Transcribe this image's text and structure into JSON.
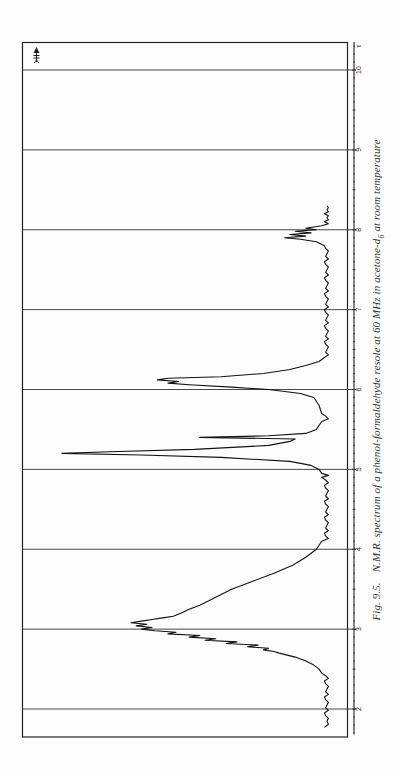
{
  "figure": {
    "caption_fig": "Fig. 9.5.",
    "caption_text_a": "N.M.R. spectrum of a phenol-formaldehyde resole at 60 MHz in acetone-d",
    "caption_sub": "6",
    "caption_text_b": " at room temperature",
    "orientation": "rotated 90° counter-clockwise",
    "field_arrow_symbol": "H0 field arrow"
  },
  "chart_data": {
    "type": "line",
    "xlabel": "τ",
    "ylabel": "",
    "xlim": [
      1.6,
      10.35
    ],
    "ylim": [
      0,
      100
    ],
    "x_ticks": [
      2,
      3,
      4,
      5,
      6,
      7,
      8,
      9,
      10
    ],
    "x_tick_labels": [
      "2",
      "3",
      "4",
      "5",
      "6",
      "7",
      "8",
      "9",
      "10"
    ],
    "axis_unit_label": "τ",
    "grid": "vertical lines at each integer τ",
    "legend": null,
    "series": [
      {
        "name": "spectrum",
        "x": [
          1.77,
          1.85,
          1.95,
          2.05,
          2.15,
          2.25,
          2.35,
          2.45,
          2.5,
          2.55,
          2.6,
          2.65,
          2.7,
          2.72,
          2.74,
          2.76,
          2.78,
          2.8,
          2.82,
          2.84,
          2.86,
          2.88,
          2.9,
          2.92,
          2.94,
          2.96,
          2.98,
          3.0,
          3.02,
          3.04,
          3.06,
          3.08,
          3.1,
          3.12,
          3.14,
          3.16,
          3.2,
          3.25,
          3.3,
          3.35,
          3.4,
          3.5,
          3.6,
          3.7,
          3.8,
          3.9,
          4.0,
          4.1,
          4.2,
          4.3,
          4.4,
          4.5,
          4.6,
          4.7,
          4.8,
          4.9,
          4.95,
          5.0,
          5.05,
          5.1,
          5.15,
          5.18,
          5.2,
          5.22,
          5.25,
          5.3,
          5.35,
          5.38,
          5.4,
          5.42,
          5.45,
          5.5,
          5.6,
          5.7,
          5.8,
          5.9,
          5.95,
          6.0,
          6.03,
          6.06,
          6.08,
          6.1,
          6.12,
          6.14,
          6.16,
          6.2,
          6.25,
          6.3,
          6.35,
          6.4,
          6.5,
          6.6,
          6.7,
          6.8,
          6.9,
          7.0,
          7.1,
          7.2,
          7.3,
          7.4,
          7.5,
          7.6,
          7.7,
          7.8,
          7.85,
          7.88,
          7.9,
          7.92,
          7.94,
          7.96,
          7.98,
          8.0,
          8.02,
          8.05,
          8.1,
          8.15,
          8.2,
          8.25,
          8.3
        ],
        "values": [
          1,
          0,
          1,
          0,
          1,
          0,
          1,
          2,
          3,
          5,
          8,
          12,
          18,
          20,
          24,
          22,
          30,
          26,
          38,
          34,
          46,
          42,
          52,
          48,
          60,
          57,
          65,
          70,
          66,
          72,
          68,
          74,
          70,
          66,
          62,
          58,
          55,
          52,
          48,
          45,
          42,
          36,
          28,
          20,
          13,
          8,
          4,
          2,
          1,
          0,
          1,
          0,
          1,
          0,
          1,
          2,
          2,
          3,
          6,
          14,
          40,
          70,
          100,
          82,
          50,
          22,
          14,
          12,
          48,
          22,
          8,
          4,
          2,
          2,
          3,
          5,
          10,
          22,
          36,
          52,
          60,
          56,
          64,
          60,
          40,
          24,
          14,
          8,
          3,
          1,
          0,
          1,
          0,
          1,
          0,
          1,
          0,
          1,
          0,
          1,
          0,
          1,
          0,
          1,
          4,
          10,
          16,
          8,
          14,
          6,
          12,
          4,
          8,
          2,
          1,
          0,
          1,
          0,
          0
        ]
      }
    ],
    "annotations": [
      "field arrow symbol at τ≈10.3 (upfield direction)"
    ]
  }
}
